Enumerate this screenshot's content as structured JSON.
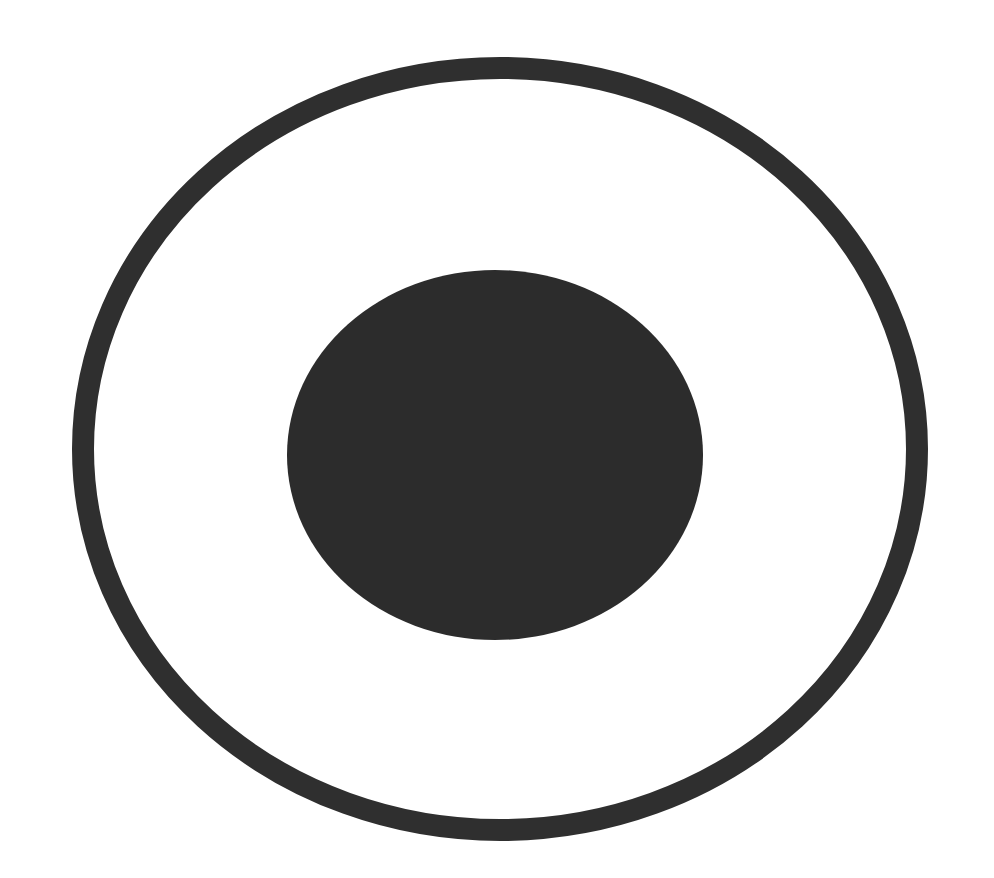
{
  "figure": {
    "background_color": "#ffffff",
    "outer_ring": {
      "cx": 500,
      "cy": 449,
      "rx": 417,
      "ry": 381,
      "stroke_width": 22,
      "color": "#2f2f2f"
    },
    "inner_disc": {
      "cx": 495,
      "cy": 455,
      "rx": 208,
      "ry": 185,
      "color": "#2c2c2c"
    }
  }
}
